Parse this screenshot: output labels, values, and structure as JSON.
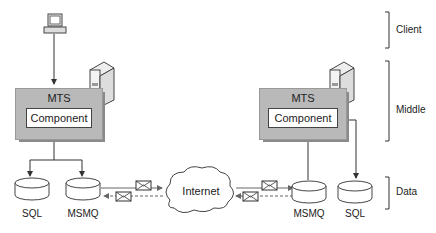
{
  "tiers": [
    {
      "label": "Client"
    },
    {
      "label": "Middle"
    },
    {
      "label": "Data"
    }
  ],
  "left_server": {
    "mts_label": "MTS",
    "component_label": "Component",
    "databases": [
      {
        "label": "SQL"
      },
      {
        "label": "MSMQ"
      }
    ]
  },
  "right_server": {
    "mts_label": "MTS",
    "component_label": "Component",
    "databases": [
      {
        "label": "MSMQ"
      },
      {
        "label": "SQL"
      }
    ]
  },
  "network": {
    "label": "Internet"
  },
  "colors": {
    "mts_fill": "#b9b9b9",
    "mts_shadow": "#8a8a8a",
    "line": "#333333"
  }
}
